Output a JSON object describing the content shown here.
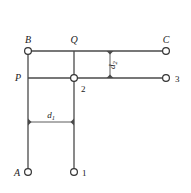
{
  "diagram": {
    "stroke_color": "#4a4a4a",
    "text_color": "#1a1a1a",
    "background": "#ffffff",
    "nodes": [
      {
        "id": "B",
        "label": "B",
        "kind": "terminal-circle",
        "x": 28,
        "y": 51,
        "label_x": 28,
        "label_y": 43,
        "label_anchor": "middle",
        "italic": true
      },
      {
        "id": "Q",
        "label": "Q",
        "kind": "junction-plain",
        "x": 74,
        "y": 51,
        "label_x": 74,
        "label_y": 43,
        "label_anchor": "middle",
        "italic": true
      },
      {
        "id": "C",
        "label": "C",
        "kind": "terminal-circle",
        "x": 166,
        "y": 51,
        "label_x": 166,
        "label_y": 43,
        "label_anchor": "middle",
        "italic": true
      },
      {
        "id": "P",
        "label": "P",
        "kind": "junction-plain",
        "x": 28,
        "y": 78,
        "label_x": 21,
        "label_y": 81,
        "label_anchor": "end",
        "italic": true
      },
      {
        "id": "2",
        "label": "2",
        "kind": "junction-circle",
        "x": 74,
        "y": 78,
        "label_x": 81,
        "label_y": 92,
        "label_anchor": "start",
        "italic": false
      },
      {
        "id": "3",
        "label": "3",
        "kind": "terminal-circle",
        "x": 166,
        "y": 78,
        "label_x": 175,
        "label_y": 82,
        "label_anchor": "start",
        "italic": false
      },
      {
        "id": "A",
        "label": "A",
        "kind": "terminal-circle",
        "x": 28,
        "y": 172,
        "label_x": 20,
        "label_y": 176,
        "label_anchor": "end",
        "italic": true
      },
      {
        "id": "1",
        "label": "1",
        "kind": "terminal-circle",
        "x": 74,
        "y": 172,
        "label_x": 82,
        "label_y": 176,
        "label_anchor": "start",
        "italic": false
      }
    ],
    "edges": [
      {
        "id": "B-Q",
        "from": "B",
        "to": "Q",
        "x1": 28,
        "y1": 51,
        "x2": 74,
        "y2": 51
      },
      {
        "id": "Q-C",
        "from": "Q",
        "to": "C",
        "x1": 74,
        "y1": 51,
        "x2": 163,
        "y2": 51
      },
      {
        "id": "P-2",
        "from": "P",
        "to": "2",
        "x1": 28,
        "y1": 78,
        "x2": 74,
        "y2": 78
      },
      {
        "id": "2-3",
        "from": "2",
        "to": "3",
        "x1": 74,
        "y1": 78,
        "x2": 163,
        "y2": 78
      },
      {
        "id": "B-A",
        "from": "B",
        "to": "A",
        "x1": 28,
        "y1": 51,
        "x2": 28,
        "y2": 169
      },
      {
        "id": "Q-1",
        "from": "Q",
        "to": "1",
        "x1": 74,
        "y1": 51,
        "x2": 74,
        "y2": 169
      }
    ],
    "dimensions": [
      {
        "id": "d1",
        "label": "d",
        "subscript": "1",
        "orientation": "horizontal",
        "x1": 28,
        "y1": 122,
        "x2": 74,
        "y2": 122,
        "label_x": 51,
        "label_y": 118
      },
      {
        "id": "d2",
        "label": "d",
        "subscript": "2",
        "orientation": "vertical",
        "x1": 110,
        "y1": 51,
        "x2": 110,
        "y2": 78,
        "label_x": 115,
        "label_y": 65,
        "label_rotation": -90
      }
    ]
  }
}
